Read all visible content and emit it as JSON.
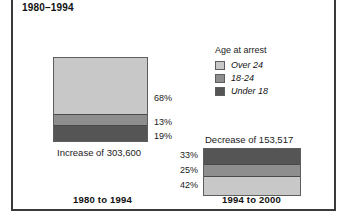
{
  "figure": {
    "title": "1980–1994"
  },
  "legend": {
    "title": "Age at arrest",
    "items": [
      {
        "label": "Over 24",
        "color": "#c8c8c8"
      },
      {
        "label": "18-24",
        "color": "#8e8e8e"
      },
      {
        "label": "Under 18",
        "color": "#555555"
      }
    ]
  },
  "panels": [
    {
      "id": "left",
      "caption_top": "",
      "caption_plain": "Increase of 303,600",
      "caption_bold": "1980 to 1994",
      "segments": [
        {
          "label": "Over 24",
          "pct_label": "68%",
          "value": 68,
          "color": "#c8c8c8"
        },
        {
          "label": "18-24",
          "pct_label": "13%",
          "value": 13,
          "color": "#8e8e8e"
        },
        {
          "label": "Under 18",
          "pct_label": "19%",
          "value": 19,
          "color": "#555555"
        }
      ]
    },
    {
      "id": "right",
      "caption_top": "Decrease of 153,517",
      "caption_plain": "",
      "caption_bold": "1994 to 2000",
      "segments": [
        {
          "label": "Under 18",
          "pct_label": "33%",
          "value": 33,
          "color": "#555555"
        },
        {
          "label": "18-24",
          "pct_label": "25%",
          "value": 25,
          "color": "#8e8e8e"
        },
        {
          "label": "Over 24",
          "pct_label": "42%",
          "value": 42,
          "color": "#c8c8c8"
        }
      ]
    }
  ],
  "chart_data": {
    "type": "bar",
    "title": "1980–1994",
    "subtitle": "",
    "xlabel": "",
    "ylabel": "",
    "stacked": true,
    "units": "percent",
    "grid": false,
    "legend_position": "center-right",
    "legend_title": "Age at arrest",
    "categories": [
      "1980 to 1994",
      "1994 to 2000"
    ],
    "category_annotations": [
      "Increase of 303,600",
      "Decrease of 153,517"
    ],
    "series": [
      {
        "name": "Over 24",
        "values": [
          68,
          42
        ],
        "color": "#c8c8c8"
      },
      {
        "name": "18-24",
        "values": [
          13,
          25
        ],
        "color": "#8e8e8e"
      },
      {
        "name": "Under 18",
        "values": [
          19,
          33
        ],
        "color": "#555555"
      }
    ],
    "stack_order": {
      "1980 to 1994": [
        "Over 24",
        "18-24",
        "Under 18"
      ],
      "1994 to 2000": [
        "Under 18",
        "18-24",
        "Over 24"
      ]
    },
    "ylim": [
      0,
      100
    ]
  }
}
